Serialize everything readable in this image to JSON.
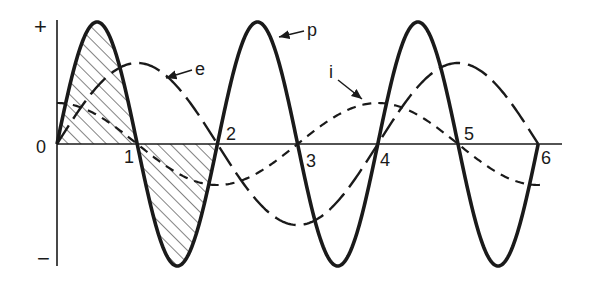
{
  "figure": {
    "type": "waveform-diagram",
    "axis": {
      "origin_label": "0",
      "plus_label": "+",
      "minus_label": "−",
      "tick_labels": [
        "1",
        "2",
        "3",
        "4",
        "5",
        "6"
      ]
    },
    "curves": [
      {
        "name": "p",
        "label": "p",
        "style": "solid-bold",
        "description": "instantaneous power"
      },
      {
        "name": "e",
        "label": "e",
        "style": "long-dash",
        "description": "voltage"
      },
      {
        "name": "i",
        "label": "i",
        "style": "short-dash",
        "description": "current"
      }
    ],
    "hatched_regions": [
      "0-1 positive lobe of p",
      "1-2 negative lobe of p"
    ],
    "colors": {
      "ink": "#1a1a1a",
      "background": "#ffffff"
    }
  },
  "chart_data": {
    "type": "line",
    "title": "",
    "xlabel": "",
    "ylabel": "",
    "x": [
      0,
      0.5,
      1,
      1.5,
      2,
      2.5,
      3,
      3.5,
      4,
      4.5,
      5,
      5.5,
      6
    ],
    "series": [
      {
        "name": "p",
        "values": [
          0,
          1,
          0,
          -1,
          0,
          1,
          0,
          -1,
          0,
          1,
          0,
          -1,
          0
        ]
      },
      {
        "name": "e",
        "values": [
          0,
          0.47,
          0.66,
          0.47,
          0,
          -0.47,
          -0.66,
          -0.47,
          0,
          0.47,
          0.66,
          0.47,
          0
        ]
      },
      {
        "name": "i",
        "values": [
          0.34,
          0.24,
          0,
          -0.24,
          -0.34,
          -0.24,
          0,
          0.24,
          0.34,
          0.24,
          0,
          -0.24,
          -0.34
        ]
      }
    ],
    "tick_labels": [
      "0",
      "1",
      "2",
      "3",
      "4",
      "5",
      "6"
    ],
    "y_tick_labels": [
      "+",
      "−"
    ],
    "grid": false,
    "legend": "inline arrow labels"
  }
}
